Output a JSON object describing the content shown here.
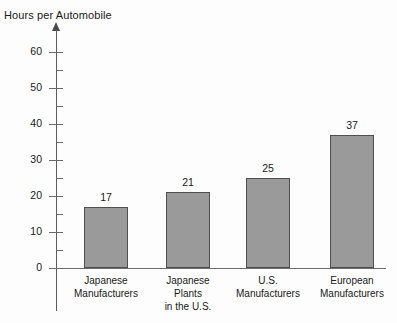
{
  "chart_data": {
    "type": "bar",
    "title": "Hours per Automobile",
    "ylabel": "Hours per Automobile",
    "xlabel": "",
    "categories": [
      "Japanese Manufacturers",
      "Japanese Plants in the U.S.",
      "U.S. Manufacturers",
      "European Manufacturers"
    ],
    "category_lines": [
      [
        "Japanese",
        "Manufacturers"
      ],
      [
        "Japanese",
        "Plants",
        "in the U.S."
      ],
      [
        "U.S.",
        "Manufacturers"
      ],
      [
        "European",
        "Manufacturers"
      ]
    ],
    "values": [
      17,
      21,
      25,
      37
    ],
    "value_labels": [
      "17",
      "21",
      "25",
      "37"
    ],
    "ylim": [
      0,
      62
    ],
    "ytick_labels": [
      "0",
      "10",
      "20",
      "30",
      "40",
      "50",
      "60"
    ],
    "ytick_values": [
      0,
      10,
      20,
      30,
      40,
      50,
      60
    ],
    "minor_tick_values": [
      5,
      15,
      25,
      35,
      45,
      55
    ],
    "grid": false,
    "legend": false,
    "bar_color": "#9a9a9a",
    "bar_border_color": "#4f4f4f",
    "axis_color": "#5d5d5d",
    "text_color": "#1a1a1a",
    "background_color": "#fdfdfd"
  }
}
